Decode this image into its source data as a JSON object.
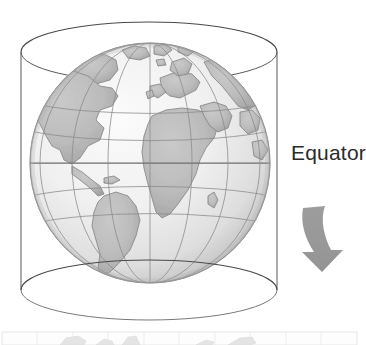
{
  "figure": {
    "type": "diagram",
    "title": "",
    "caption": "",
    "background_color": "#ffffff",
    "annotations": [
      {
        "id": "equator-label",
        "text": "Equator",
        "color": "#2b2b2b",
        "x": 291,
        "y": 140,
        "font_size": 21,
        "clipped_at_right_edge": true
      }
    ],
    "arrow": {
      "id": "projection-arrow",
      "shape": "curved-down-arrow",
      "color": "#9a9a9a",
      "direction": "down",
      "x": 300,
      "y": 205,
      "width": 46,
      "height": 66
    },
    "cylinder": {
      "id": "projection-cylinder",
      "stroke_color": "#4a4a4a",
      "stroke_width": 1,
      "fill": "none",
      "center_x": 149,
      "top_ellipse_cy": 52,
      "bottom_ellipse_cy": 290,
      "rx": 128,
      "ry": 30
    },
    "globe": {
      "id": "earth-globe",
      "center_x": 150,
      "center_y": 163,
      "radius": 120,
      "ocean_color": "#eeeeee",
      "land_color": "#bcbcbc",
      "land_outline_color": "#8d8d8d",
      "graticule_color": "#8a8a8a",
      "shadow_color": "#b5b5b5",
      "equator_line_color": "#707070",
      "continents": [
        "North America",
        "South America",
        "Greenland",
        "Europe",
        "Africa",
        "Asia",
        "Middle East"
      ],
      "graticule": {
        "latitude_lines": [
          "60N",
          "30N",
          "0 (Equator)",
          "30S",
          "60S"
        ],
        "longitude_lines": [
          "-120",
          "-90",
          "-60",
          "-30",
          "0",
          "30",
          "60",
          "90"
        ]
      }
    },
    "bottom_strip": {
      "id": "flat-map-strip",
      "description": "faint top sliver of resulting flat projected world map",
      "y": 331,
      "height": 14,
      "grid_color": "#d8d8d8",
      "land_color": "#cfcfcf",
      "border_color": "#c4c4c4",
      "grid_columns": 10
    }
  }
}
